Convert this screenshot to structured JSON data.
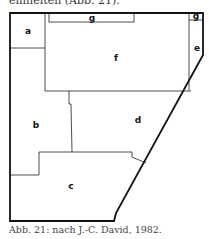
{
  "header": {
    "cut_text": "einheiten (Abb. 21)."
  },
  "diagram": {
    "labels": {
      "a": "a",
      "b": "b",
      "c": "c",
      "d": "d",
      "e": "e",
      "f": "f",
      "g1": "g",
      "g2": "g"
    }
  },
  "caption": "Abb. 21:  nach J.-C. David, 1982."
}
